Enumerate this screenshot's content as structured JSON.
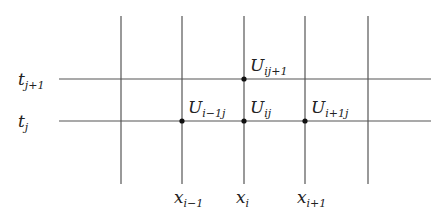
{
  "diagram": {
    "type": "finite-difference-grid",
    "colors": {
      "line": "#555555",
      "node": "#111111",
      "text": "#222222",
      "background": "#ffffff"
    },
    "vertical_lines_x": [
      121,
      182,
      244,
      305,
      368
    ],
    "vertical_y_range": [
      16,
      184
    ],
    "horizontal_lines": [
      {
        "y": 79,
        "label_main": "t",
        "label_sub": "j+1"
      },
      {
        "y": 121,
        "label_main": "t",
        "label_sub": "j"
      }
    ],
    "horizontal_x_range": [
      59,
      431
    ],
    "x_labels": [
      {
        "x": 182,
        "main": "x",
        "sub": "i−1"
      },
      {
        "x": 244,
        "main": "x",
        "sub": "i"
      },
      {
        "x": 305,
        "main": "x",
        "sub": "i+1"
      }
    ],
    "nodes": [
      {
        "x": 244,
        "y": 79,
        "main": "U",
        "sub": "ij+1"
      },
      {
        "x": 182,
        "y": 121,
        "main": "U",
        "sub": "i−1j"
      },
      {
        "x": 244,
        "y": 121,
        "main": "U",
        "sub": "ij"
      },
      {
        "x": 305,
        "y": 121,
        "main": "U",
        "sub": "i+1j"
      }
    ]
  }
}
